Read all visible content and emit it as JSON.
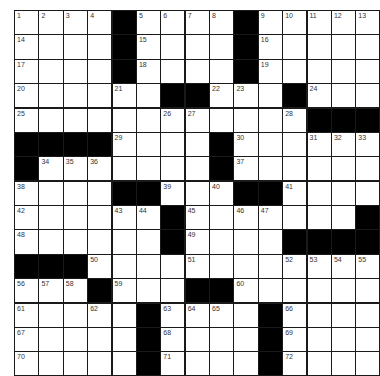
{
  "puzzle": {
    "rows": 15,
    "cols": 15,
    "colors": {
      "block": "#000000",
      "cell": "#ffffff",
      "border": "#1a1a1a",
      "number": "#333333"
    },
    "grid": [
      [
        "1",
        "2",
        "3",
        "4",
        "#",
        "5",
        "6",
        "7",
        "8",
        "#",
        "9",
        "10",
        "11",
        "12",
        "13"
      ],
      [
        "14",
        "",
        "",
        "",
        "#",
        "15",
        "",
        "",
        "",
        "#",
        "16",
        "",
        "",
        "",
        ""
      ],
      [
        "17",
        "",
        "",
        "",
        "#",
        "18",
        "",
        "",
        "",
        "#",
        "19",
        "",
        "",
        "",
        ""
      ],
      [
        "20",
        "",
        "",
        "",
        "21",
        "",
        "#",
        "#",
        "22",
        "23",
        "",
        "#",
        "24",
        "",
        ""
      ],
      [
        "25",
        "",
        "",
        "",
        "",
        "",
        "26",
        "27",
        "",
        "",
        "",
        "28",
        "#",
        "#",
        "#"
      ],
      [
        "#",
        "#",
        "#",
        "#",
        "29",
        "",
        "",
        "",
        "#",
        "30",
        "",
        "",
        "31",
        "32",
        "33"
      ],
      [
        "#",
        "34",
        "35",
        "36",
        "",
        "",
        "",
        "",
        "#",
        "37",
        "",
        "",
        "",
        "",
        ""
      ],
      [
        "38",
        "",
        "",
        "",
        "#",
        "#",
        "39",
        "",
        "40",
        "#",
        "#",
        "41",
        "",
        "",
        ""
      ],
      [
        "42",
        "",
        "",
        "",
        "43",
        "44",
        "#",
        "45",
        "",
        "46",
        "47",
        "",
        "",
        "",
        "#"
      ],
      [
        "48",
        "",
        "",
        "",
        "",
        "",
        "#",
        "49",
        "",
        "",
        "",
        "#",
        "#",
        "#",
        "#"
      ],
      [
        "#",
        "#",
        "#",
        "50",
        "",
        "",
        "",
        "51",
        "",
        "",
        "",
        "52",
        "53",
        "54",
        "55"
      ],
      [
        "56",
        "57",
        "58",
        "#",
        "59",
        "",
        "",
        "#",
        "#",
        "60",
        "",
        "",
        "",
        "",
        ""
      ],
      [
        "61",
        "",
        "",
        "62",
        "",
        "#",
        "63",
        "64",
        "65",
        "",
        "#",
        "66",
        "",
        "",
        ""
      ],
      [
        "67",
        "",
        "",
        "",
        "",
        "#",
        "68",
        "",
        "",
        "",
        "#",
        "69",
        "",
        "",
        ""
      ],
      [
        "70",
        "",
        "",
        "",
        "",
        "#",
        "71",
        "",
        "",
        "",
        "#",
        "72",
        "",
        "",
        ""
      ]
    ]
  }
}
